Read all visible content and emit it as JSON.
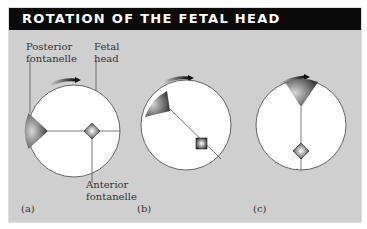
{
  "figure": {
    "title": "ROTATION OF THE FETAL HEAD",
    "labels": {
      "posterior_fontanelle": [
        "Posterior",
        "fontanelle"
      ],
      "fetal_head": [
        "Fetal",
        "head"
      ],
      "anterior_fontanelle": [
        "Anterior",
        "fontanelle"
      ]
    },
    "panels": [
      {
        "id": "a",
        "label": "(a)"
      },
      {
        "id": "b",
        "label": "(b)"
      },
      {
        "id": "c",
        "label": "(c)"
      }
    ],
    "icons": {
      "rotation_arrow": "clockwise-rotation-arrow-icon",
      "posterior_fontanelle": "triangle-fontanelle-icon",
      "anterior_fontanelle": "diamond-fontanelle-icon"
    },
    "colors": {
      "header_bg": "#0a0a0a",
      "panel_bg": "#cfcfcf",
      "circle_fill": "#ffffff",
      "line": "#555555"
    }
  }
}
